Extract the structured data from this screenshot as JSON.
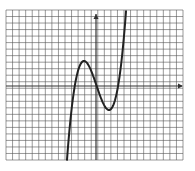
{
  "figure": {
    "grid": {
      "columns": 27,
      "rows": 23,
      "left": 6,
      "top": 10,
      "right": 183,
      "bottom": 160,
      "line_color": "#555555",
      "background": "#ffffff"
    },
    "axes": {
      "x_axis_y": 86,
      "y_axis_x": 96,
      "color": "#333333",
      "x_arrow": "right",
      "y_arrow": "up"
    },
    "curve": {
      "type": "cubic",
      "color": "#222222",
      "stroke_width": 2,
      "features": {
        "local_max": {
          "x": 84,
          "y": 61
        },
        "local_min": {
          "x": 109,
          "y": 110
        },
        "enters_bottom_at_x": 48,
        "exits_top_at_x": 146
      }
    }
  }
}
